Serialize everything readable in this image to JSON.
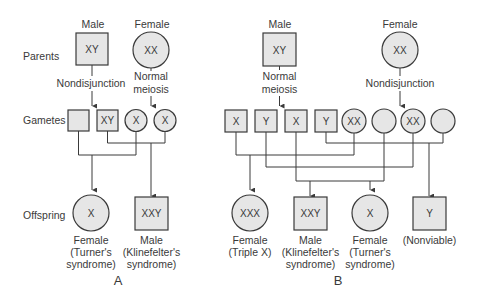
{
  "row_labels": {
    "parents": "Parents",
    "gametes": "Gametes",
    "offspring": "Offspring"
  },
  "colors": {
    "shape_fill": "#e6e6e6",
    "stroke": "#3a3a3a",
    "text": "#3a3a3a"
  },
  "panel_a": {
    "label": "A",
    "male": {
      "sex_label": "Male",
      "genotype": "XY",
      "process": "Nondisjunction"
    },
    "female": {
      "sex_label": "Female",
      "genotype": "XX",
      "process_line1": "Normal",
      "process_line2": "meiosis"
    },
    "gametes": [
      {
        "shape": "square",
        "genotype": ""
      },
      {
        "shape": "square",
        "genotype": "XY"
      },
      {
        "shape": "circle",
        "genotype": "X"
      },
      {
        "shape": "circle",
        "genotype": "X"
      }
    ],
    "offspring": [
      {
        "shape": "circle",
        "genotype": "X",
        "line1": "Female",
        "line2": "(Turner's",
        "line3": "syndrome)"
      },
      {
        "shape": "square",
        "genotype": "XXY",
        "line1": "Male",
        "line2": "(Klinefelter's",
        "line3": "syndrome)"
      }
    ]
  },
  "panel_b": {
    "label": "B",
    "male": {
      "sex_label": "Male",
      "genotype": "XY",
      "process_line1": "Normal",
      "process_line2": "meiosis"
    },
    "female": {
      "sex_label": "Female",
      "genotype": "XX",
      "process": "Nondisjunction"
    },
    "gametes": [
      {
        "shape": "square",
        "genotype": "X"
      },
      {
        "shape": "square",
        "genotype": "Y"
      },
      {
        "shape": "square",
        "genotype": "X"
      },
      {
        "shape": "square",
        "genotype": "Y"
      },
      {
        "shape": "circle",
        "genotype": "XX"
      },
      {
        "shape": "circle",
        "genotype": ""
      },
      {
        "shape": "circle",
        "genotype": "XX"
      },
      {
        "shape": "circle",
        "genotype": ""
      }
    ],
    "offspring": [
      {
        "shape": "circle",
        "genotype": "XXX",
        "line1": "Female",
        "line2": "(Triple X)"
      },
      {
        "shape": "square",
        "genotype": "XXY",
        "line1": "Male",
        "line2": "(Klinefelter's",
        "line3": "syndrome)"
      },
      {
        "shape": "circle",
        "genotype": "X",
        "line1": "Female",
        "line2": "(Turner's",
        "line3": "syndrome)"
      },
      {
        "shape": "square",
        "genotype": "Y",
        "line1": "(Nonviable)"
      }
    ]
  }
}
